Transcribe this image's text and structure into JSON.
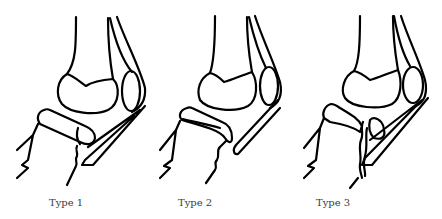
{
  "figure": {
    "panels": [
      {
        "id": "type-1",
        "label": "Type 1"
      },
      {
        "id": "type-2",
        "label": "Type 2"
      },
      {
        "id": "type-3",
        "label": "Type 3"
      }
    ]
  },
  "colors": {
    "line": "#000000",
    "background": "#ffffff",
    "label": "#3a3a3a"
  }
}
